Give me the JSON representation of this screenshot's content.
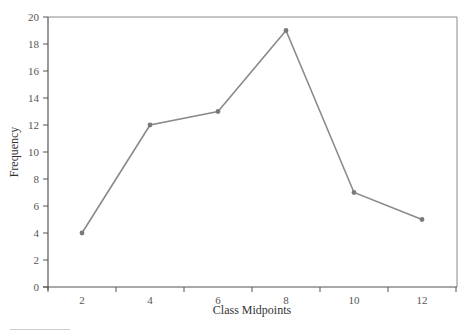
{
  "chart_data": {
    "type": "line",
    "title": "",
    "xlabel": "Class Midpoints",
    "ylabel": "Frequency",
    "x": [
      2,
      4,
      6,
      8,
      10,
      12
    ],
    "categories": [
      "2",
      "4",
      "6",
      "8",
      "10",
      "12"
    ],
    "series": [
      {
        "name": "Frequency",
        "values": [
          4,
          12,
          13,
          19,
          7,
          5
        ]
      }
    ],
    "values": [
      4,
      12,
      13,
      19,
      7,
      5
    ],
    "ylim": [
      0,
      20
    ],
    "yticks": [
      0,
      2,
      4,
      6,
      8,
      10,
      12,
      14,
      16,
      18,
      20
    ],
    "xlim": [
      1,
      13
    ],
    "grid": false,
    "legend": null,
    "colors": {
      "line": "#8a8a8a",
      "marker": "#7a7a7a",
      "axis": "#555555",
      "frame": "#8a8a8a"
    }
  }
}
